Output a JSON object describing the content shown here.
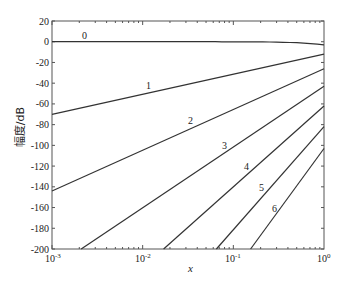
{
  "chart_data": {
    "type": "line",
    "title": "",
    "xlabel": "x",
    "ylabel": "幅度/dB",
    "xscale": "log",
    "xlim": [
      0.001,
      1
    ],
    "ylim": [
      -200,
      20
    ],
    "xticks": [
      "10^-3",
      "10^-2",
      "10^-1",
      "10^0"
    ],
    "yticks": [
      20,
      0,
      -20,
      -40,
      -60,
      -80,
      -100,
      -120,
      -140,
      -160,
      -180,
      -200
    ],
    "grid": false,
    "legend": "inline curve labels",
    "series": [
      {
        "name": "0",
        "x": [
          0.001,
          0.01,
          0.1,
          0.3,
          1
        ],
        "y": [
          0,
          0,
          -0.5,
          -1,
          -3
        ]
      },
      {
        "name": "1",
        "x": [
          0.001,
          1
        ],
        "y": [
          -70,
          -12
        ]
      },
      {
        "name": "2",
        "x": [
          0.001,
          1
        ],
        "y": [
          -144,
          -26
        ]
      },
      {
        "name": "3",
        "x": [
          0.0021,
          1
        ],
        "y": [
          -200,
          -43
        ]
      },
      {
        "name": "4",
        "x": [
          0.017,
          1
        ],
        "y": [
          -200,
          -62
        ]
      },
      {
        "name": "5",
        "x": [
          0.065,
          1
        ],
        "y": [
          -200,
          -82
        ]
      },
      {
        "name": "6",
        "x": [
          0.155,
          1
        ],
        "y": [
          -200,
          -103
        ]
      }
    ]
  },
  "labels": {
    "xlabel": "x",
    "ylabel": "幅度/dB",
    "yticks": [
      "20",
      "0",
      "-20",
      "-40",
      "-60",
      "-80",
      "-100",
      "-120",
      "-140",
      "-160",
      "-180",
      "-200"
    ],
    "curves": [
      "0",
      "1",
      "2",
      "3",
      "4",
      "5",
      "6"
    ]
  }
}
